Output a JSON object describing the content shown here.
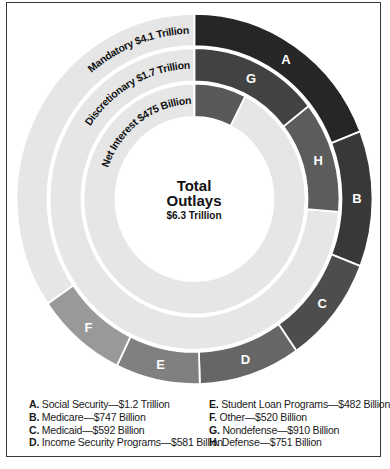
{
  "chart_data": {
    "type": "pie",
    "subtype": "multi-ring donut (sunburst)",
    "title": "Total Outlays",
    "total": "$6.3 Trillion",
    "total_value_billion": 6300,
    "rings": [
      {
        "name": "Mandatory",
        "label": "Mandatory $4.1 Trillion",
        "value_billion": 4100,
        "segments": [
          {
            "key": "A",
            "name": "Social Security",
            "value_billion": 1200,
            "display": "$1.2 Trillion",
            "color": "#262626"
          },
          {
            "key": "B",
            "name": "Medicare",
            "value_billion": 747,
            "display": "$747 Billion",
            "color": "#383838"
          },
          {
            "key": "C",
            "name": "Medicaid",
            "value_billion": 592,
            "display": "$592 Billion",
            "color": "#4d4d4d"
          },
          {
            "key": "D",
            "name": "Income Security Programs",
            "value_billion": 581,
            "display": "$581 Billion",
            "color": "#666666"
          },
          {
            "key": "E",
            "name": "Student Loan Programs",
            "value_billion": 482,
            "display": "$482 Billion",
            "color": "#808080"
          },
          {
            "key": "F",
            "name": "Other",
            "value_billion": 520,
            "display": "$520 Billion",
            "color": "#999999"
          }
        ]
      },
      {
        "name": "Discretionary",
        "label": "Discretionary $1.7 Trillion",
        "value_billion": 1700,
        "segments": [
          {
            "key": "G",
            "name": "Nondefense",
            "value_billion": 910,
            "display": "$910 Billion",
            "color": "#424242"
          },
          {
            "key": "H",
            "name": "Defense",
            "value_billion": 751,
            "display": "$751 Billion",
            "color": "#5c5c5c"
          }
        ]
      },
      {
        "name": "Net Interest",
        "label": "Net Interest $475 Billion",
        "value_billion": 475,
        "segments": [
          {
            "key": "",
            "name": "Net Interest",
            "value_billion": 475,
            "display": "$475 Billion",
            "color": "#595959"
          }
        ]
      }
    ],
    "remainder_color": "#e6e6e6",
    "legend_position": "bottom"
  },
  "center": {
    "title_line1": "Total",
    "title_line2": "Outlays",
    "amount": "$6.3 Trillion"
  },
  "legend": {
    "left": [
      {
        "key": "A.",
        "text": "Social Security—$1.2 Trillion"
      },
      {
        "key": "B.",
        "text": "Medicare—$747 Billion"
      },
      {
        "key": "C.",
        "text": "Medicaid—$592 Billion"
      },
      {
        "key": "D.",
        "text": "Income Security Programs—$581 Billion"
      }
    ],
    "right": [
      {
        "key": "E.",
        "text": "Student Loan Programs—$482 Billion"
      },
      {
        "key": "F.",
        "text": "Other—$520 Billion"
      },
      {
        "key": "G.",
        "text": "Nondefense—$910 Billion"
      },
      {
        "key": "H.",
        "text": "Defense—$751 Billion"
      }
    ]
  }
}
